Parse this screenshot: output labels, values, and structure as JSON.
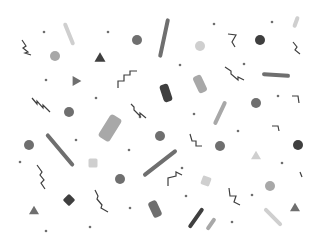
{
  "pattern": {
    "description": "Grayscale confetti / memphis pattern",
    "background": "#ffffff",
    "colors": {
      "dark": "#3f3f3f",
      "mid": "#6f6f6f",
      "light": "#a8a8a8",
      "pale": "#cfcfcf"
    }
  },
  "shapes": [
    {
      "type": "dot",
      "x": 44,
      "y": 32,
      "c": "mid"
    },
    {
      "type": "dot",
      "x": 108,
      "y": 32,
      "c": "mid"
    },
    {
      "type": "dot",
      "x": 214,
      "y": 24,
      "c": "mid"
    },
    {
      "type": "dot",
      "x": 272,
      "y": 22,
      "c": "mid"
    },
    {
      "type": "dot",
      "x": 46,
      "y": 80,
      "c": "mid"
    },
    {
      "type": "dot",
      "x": 96,
      "y": 98,
      "c": "mid"
    },
    {
      "type": "dot",
      "x": 180,
      "y": 65,
      "c": "mid"
    },
    {
      "type": "dot",
      "x": 244,
      "y": 64,
      "c": "mid"
    },
    {
      "type": "dot",
      "x": 140,
      "y": 117,
      "c": "mid"
    },
    {
      "type": "dot",
      "x": 194,
      "y": 114,
      "c": "mid"
    },
    {
      "type": "dot",
      "x": 278,
      "y": 96,
      "c": "mid"
    },
    {
      "type": "dot",
      "x": 129,
      "y": 150,
      "c": "mid"
    },
    {
      "type": "dot",
      "x": 238,
      "y": 131,
      "c": "mid"
    },
    {
      "type": "dot",
      "x": 76,
      "y": 140,
      "c": "mid"
    },
    {
      "type": "dot",
      "x": 182,
      "y": 168,
      "c": "mid"
    },
    {
      "type": "dot",
      "x": 282,
      "y": 163,
      "c": "mid"
    },
    {
      "type": "dot",
      "x": 130,
      "y": 208,
      "c": "mid"
    },
    {
      "type": "dot",
      "x": 186,
      "y": 196,
      "c": "mid"
    },
    {
      "type": "dot",
      "x": 252,
      "y": 195,
      "c": "mid"
    },
    {
      "type": "dot",
      "x": 90,
      "y": 227,
      "c": "mid"
    },
    {
      "type": "dot",
      "x": 232,
      "y": 222,
      "c": "mid"
    },
    {
      "type": "dot",
      "x": 46,
      "y": 231,
      "c": "mid"
    },
    {
      "type": "dot",
      "x": 20,
      "y": 162,
      "c": "mid"
    },
    {
      "type": "circle",
      "x": 137,
      "y": 40,
      "r": 5,
      "c": "mid"
    },
    {
      "type": "circle",
      "x": 55,
      "y": 56,
      "r": 5,
      "c": "light"
    },
    {
      "type": "circle",
      "x": 260,
      "y": 40,
      "r": 5,
      "c": "dark"
    },
    {
      "type": "circle",
      "x": 200,
      "y": 46,
      "r": 5,
      "c": "pale"
    },
    {
      "type": "circle",
      "x": 69,
      "y": 112,
      "r": 5,
      "c": "mid"
    },
    {
      "type": "circle",
      "x": 256,
      "y": 103,
      "r": 5,
      "c": "mid"
    },
    {
      "type": "circle",
      "x": 160,
      "y": 136,
      "r": 5,
      "c": "mid"
    },
    {
      "type": "circle",
      "x": 29,
      "y": 145,
      "r": 5,
      "c": "mid"
    },
    {
      "type": "circle",
      "x": 220,
      "y": 146,
      "r": 5,
      "c": "mid"
    },
    {
      "type": "circle",
      "x": 120,
      "y": 179,
      "r": 5,
      "c": "mid"
    },
    {
      "type": "circle",
      "x": 270,
      "y": 186,
      "r": 5,
      "c": "light"
    },
    {
      "type": "circle",
      "x": 298,
      "y": 145,
      "r": 5,
      "c": "dark"
    },
    {
      "type": "tri",
      "x": 100,
      "y": 57,
      "s": 11,
      "rot": 0,
      "c": "dark"
    },
    {
      "type": "tri",
      "x": 77,
      "y": 81,
      "s": 10,
      "rot": 90,
      "c": "mid"
    },
    {
      "type": "tri",
      "x": 256,
      "y": 155,
      "s": 10,
      "rot": 0,
      "c": "pale"
    },
    {
      "type": "tri",
      "x": 34,
      "y": 210,
      "s": 10,
      "rot": 0,
      "c": "mid"
    },
    {
      "type": "tri",
      "x": 295,
      "y": 207,
      "s": 10,
      "rot": 0,
      "c": "mid"
    },
    {
      "type": "pill",
      "x": 69,
      "y": 34,
      "w": 4,
      "h": 24,
      "rot": -22,
      "c": "pale"
    },
    {
      "type": "pill",
      "x": 164,
      "y": 38,
      "w": 4,
      "h": 40,
      "rot": 12,
      "c": "mid"
    },
    {
      "type": "pill",
      "x": 296,
      "y": 22,
      "w": 4,
      "h": 12,
      "rot": 20,
      "c": "pale"
    },
    {
      "type": "pill",
      "x": 166,
      "y": 93,
      "w": 9,
      "h": 18,
      "rot": -18,
      "c": "dark"
    },
    {
      "type": "pill",
      "x": 200,
      "y": 84,
      "w": 9,
      "h": 18,
      "rot": -25,
      "c": "light"
    },
    {
      "type": "pill",
      "x": 110,
      "y": 128,
      "w": 13,
      "h": 26,
      "rot": 32,
      "c": "light"
    },
    {
      "type": "pill",
      "x": 276,
      "y": 75,
      "w": 4,
      "h": 28,
      "rot": -86,
      "c": "mid"
    },
    {
      "type": "pill",
      "x": 60,
      "y": 150,
      "w": 4,
      "h": 42,
      "rot": -40,
      "c": "mid"
    },
    {
      "type": "pill",
      "x": 220,
      "y": 113,
      "w": 4,
      "h": 26,
      "rot": 25,
      "c": "light"
    },
    {
      "type": "pill",
      "x": 160,
      "y": 163,
      "w": 4,
      "h": 42,
      "rot": 52,
      "c": "mid"
    },
    {
      "type": "pill",
      "x": 155,
      "y": 209,
      "w": 9,
      "h": 17,
      "rot": -25,
      "c": "mid"
    },
    {
      "type": "pill",
      "x": 196,
      "y": 218,
      "w": 4,
      "h": 24,
      "rot": 35,
      "c": "dark"
    },
    {
      "type": "pill",
      "x": 211,
      "y": 224,
      "w": 4,
      "h": 14,
      "rot": 35,
      "c": "light"
    },
    {
      "type": "pill",
      "x": 273,
      "y": 217,
      "w": 4,
      "h": 24,
      "rot": -45,
      "c": "pale"
    },
    {
      "type": "square",
      "x": 93,
      "y": 163,
      "s": 9,
      "rot": 0,
      "c": "pale"
    },
    {
      "type": "square",
      "x": 206,
      "y": 181,
      "s": 9,
      "rot": 20,
      "c": "pale"
    },
    {
      "type": "square",
      "x": 69,
      "y": 200,
      "s": 9,
      "rot": 45,
      "c": "dark"
    },
    {
      "type": "zig",
      "pts": "22,40 26,46 23,48 28,52 25,53 31,55",
      "c": "dark"
    },
    {
      "type": "zig",
      "pts": "118,88 118,81 124,81 124,75 130,75 130,71 137,71",
      "c": "dark"
    },
    {
      "type": "zig",
      "pts": "32,98 37,104 37,101 43,108 43,105 50,112",
      "c": "dark"
    },
    {
      "type": "zig",
      "pts": "131,104 134,107 134,110 140,116 140,113 146,118",
      "c": "dark"
    },
    {
      "type": "zig",
      "pts": "228,34 236,35 232,42 235,47",
      "c": "dark"
    },
    {
      "type": "zig",
      "pts": "225,67 231,71 231,74 238,80 238,77 244,80",
      "c": "dark"
    },
    {
      "type": "zig",
      "pts": "293,42 297,47 295,50 300,54",
      "c": "dark"
    },
    {
      "type": "zig",
      "pts": "292,96 298,96 299,103",
      "c": "dark"
    },
    {
      "type": "zig",
      "pts": "37,165 42,172 40,175 44,180 41,183 45,189",
      "c": "dark"
    },
    {
      "type": "zig",
      "pts": "95,190 98,196 97,199 102,205 101,208 108,212",
      "c": "dark"
    },
    {
      "type": "zig",
      "pts": "190,134 192,141 196,141 196,146 202,146",
      "c": "dark"
    },
    {
      "type": "zig",
      "pts": "168,186 168,178 176,176 176,172 182,175",
      "c": "dark"
    },
    {
      "type": "zig",
      "pts": "229,188 230,196 236,196 234,202 240,205",
      "c": "dark"
    },
    {
      "type": "zig",
      "pts": "272,126 278,126 279,131",
      "c": "dark"
    },
    {
      "type": "zig",
      "pts": "300,172 302,177",
      "c": "dark"
    }
  ]
}
